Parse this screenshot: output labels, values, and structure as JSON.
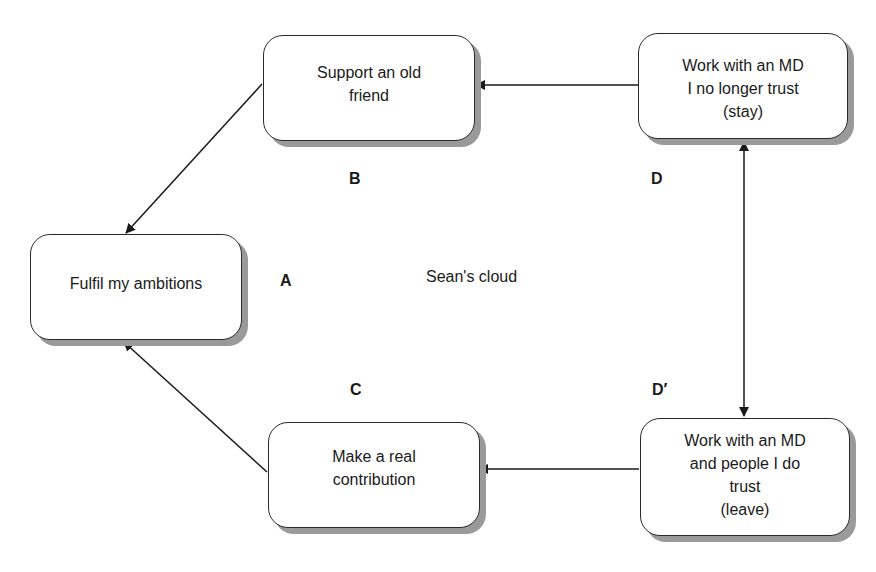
{
  "diagram": {
    "title": "Sean's cloud",
    "nodes": {
      "A": {
        "text": "Fulfil my ambitions"
      },
      "B": {
        "text": "Support an old\nfriend"
      },
      "C": {
        "text": "Make a real\ncontribution"
      },
      "D": {
        "text": "Work with an MD\nI no longer trust\n(stay)"
      },
      "D_prime": {
        "text": "Work with an MD\nand people I do\ntrust\n(leave)"
      }
    },
    "labels": {
      "A": "A",
      "B": "B",
      "C": "C",
      "D": "D",
      "D_prime": "D′"
    },
    "edges": [
      {
        "from": "B",
        "to": "A"
      },
      {
        "from": "C",
        "to": "A"
      },
      {
        "from": "D",
        "to": "B"
      },
      {
        "from": "D_prime",
        "to": "C"
      },
      {
        "from": "D",
        "to": "D_prime",
        "bidirectional": true
      }
    ]
  }
}
